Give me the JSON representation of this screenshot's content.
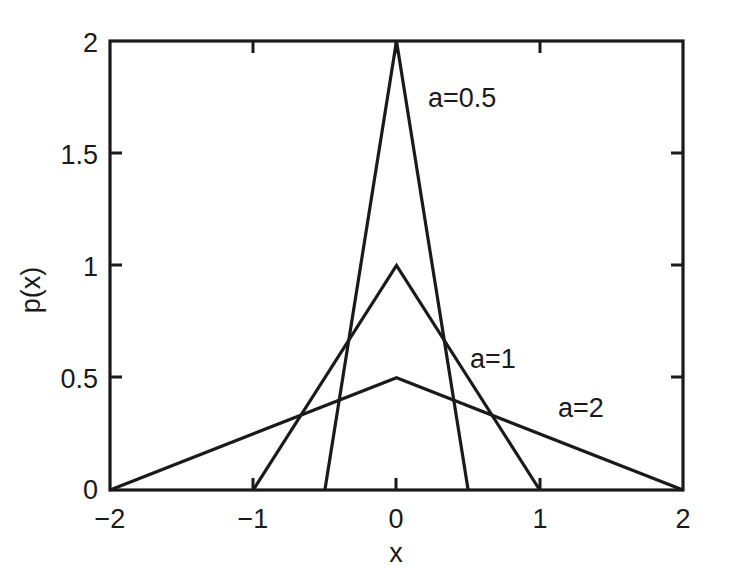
{
  "chart_data": {
    "type": "line",
    "title": "",
    "xlabel": "x",
    "ylabel": "p(x)",
    "xlim": [
      -2,
      2
    ],
    "ylim": [
      0,
      2
    ],
    "grid": false,
    "legend_position": "inline-annotations",
    "x_ticks": [
      {
        "value": -2,
        "label": "−2"
      },
      {
        "value": -1,
        "label": "−1"
      },
      {
        "value": 0,
        "label": "0"
      },
      {
        "value": 1,
        "label": "1"
      },
      {
        "value": 2,
        "label": "2"
      }
    ],
    "y_ticks": [
      {
        "value": 0,
        "label": "0"
      },
      {
        "value": 0.5,
        "label": "0.5"
      },
      {
        "value": 1,
        "label": "1"
      },
      {
        "value": 1.5,
        "label": "1.5"
      },
      {
        "value": 2,
        "label": "2"
      }
    ],
    "series": [
      {
        "name": "a=0.5",
        "annotation": "a=0.5",
        "peak_value": 2,
        "support": [
          -0.5,
          0.5
        ],
        "x": [
          -0.5,
          0,
          0.5
        ],
        "values": [
          0,
          2,
          0
        ]
      },
      {
        "name": "a=1",
        "annotation": "a=1",
        "peak_value": 1,
        "support": [
          -1,
          1
        ],
        "x": [
          -1,
          0,
          1
        ],
        "values": [
          0,
          1,
          0
        ]
      },
      {
        "name": "a=2",
        "annotation": "a=2",
        "peak_value": 0.5,
        "support": [
          -2,
          2
        ],
        "x": [
          -2,
          0,
          2
        ],
        "values": [
          0,
          0.5,
          0
        ]
      }
    ],
    "annotations": [
      {
        "text": "a=0.5",
        "x": 0.27,
        "y": 1.72
      },
      {
        "text": "a=1",
        "x": 0.52,
        "y": 0.71
      },
      {
        "text": "a=2",
        "x": 1.19,
        "y": 0.39
      }
    ],
    "colors": {
      "line": "#1a1a1a",
      "axis": "#1a1a1a",
      "background": "#ffffff"
    }
  }
}
